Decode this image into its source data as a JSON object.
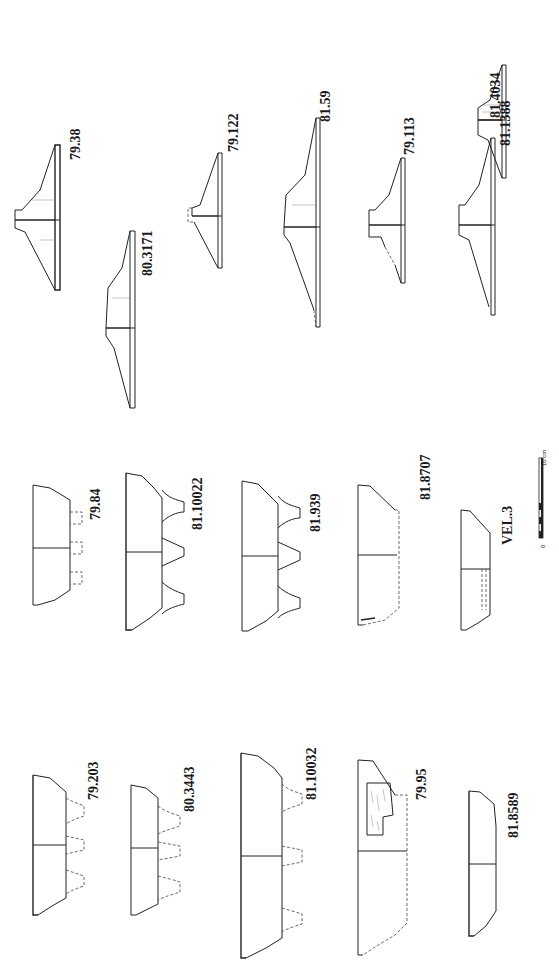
{
  "plate": {
    "orientation": "rotated-90-ccw",
    "background": "#ffffff",
    "ink": "#1a1a1a"
  },
  "groups": {
    "lids": {
      "description": "Lid / cover profiles (top half)",
      "items": [
        {
          "id": "81.4034",
          "label": "81.4034"
        },
        {
          "id": "79.38",
          "label": "79.38"
        },
        {
          "id": "79.122",
          "label": "79.122"
        },
        {
          "id": "80.3171",
          "label": "80.3171"
        },
        {
          "id": "81.59",
          "label": "81.59"
        },
        {
          "id": "79.113",
          "label": "79.113"
        },
        {
          "id": "81.1388",
          "label": "81.1388"
        }
      ]
    },
    "tripod_bowls_center": {
      "items": [
        {
          "id": "79.84",
          "label": "79.84"
        },
        {
          "id": "81.10022",
          "label": "81.10022"
        },
        {
          "id": "81.939",
          "label": "81.939"
        },
        {
          "id": "81.8707",
          "label": "81.8707"
        },
        {
          "id": "VEL.3",
          "label": "VEL.3"
        }
      ]
    },
    "tripod_bowls_left": {
      "items": [
        {
          "id": "79.203",
          "label": "79.203"
        },
        {
          "id": "80.3443",
          "label": "80.3443"
        },
        {
          "id": "81.10032",
          "label": "81.10032"
        },
        {
          "id": "79.95",
          "label": "79.95"
        },
        {
          "id": "81.8589",
          "label": "81.8589"
        }
      ]
    }
  },
  "scale_bar": {
    "start_label": "0",
    "end_label": "10 cm",
    "segments": 5
  }
}
